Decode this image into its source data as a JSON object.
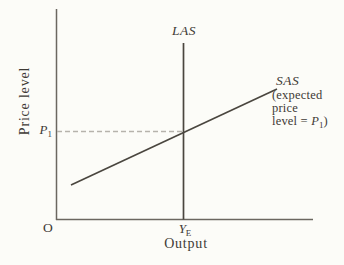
{
  "figure": {
    "las": {
      "label": "LAS"
    },
    "sas": {
      "label": "SAS",
      "note_line1": "(expected",
      "note_line2": "price",
      "note_line3_prefix": "level = ",
      "note_line3_var": "P",
      "note_line3_sub": "1",
      "note_line3_suffix": ")"
    },
    "axes": {
      "y_label": "Price level",
      "x_label": "Output",
      "origin": "O"
    },
    "points": {
      "price_var": "P",
      "price_sub": "1",
      "output_var": "Y",
      "output_sub": "E"
    },
    "colors": {
      "background": "#fcfcf8",
      "axis_line": "#6b6760",
      "curve_line": "#4a463f",
      "dashed_line": "#b6b3ac",
      "text": "#3e3a35"
    },
    "diagram": {
      "type": "aggregate-supply-graph",
      "curves": [
        {
          "name": "LAS",
          "shape": "vertical line at equilibrium output"
        },
        {
          "name": "SAS",
          "shape": "upward-sloping line",
          "annotation": "expected price level = P1"
        }
      ],
      "marked_point": {
        "price": "P1",
        "output": "YE",
        "note": "dashed horizontal guide from P1 on the price axis to the LAS/SAS intersection"
      }
    }
  }
}
